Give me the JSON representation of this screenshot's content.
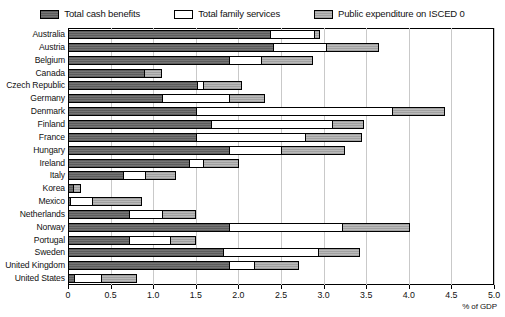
{
  "chart_data": {
    "type": "bar",
    "orientation": "horizontal",
    "stacked": true,
    "title": "",
    "xlabel": "% of GDP",
    "ylabel": "",
    "xlim": [
      0,
      5.0
    ],
    "xticks": [
      0,
      0.5,
      1.0,
      1.5,
      2.0,
      2.5,
      3.0,
      3.5,
      4.0,
      4.5,
      5.0
    ],
    "xticklabels": [
      "0",
      "0.5",
      "1.0",
      "1.5",
      "2.0",
      "2.5",
      "3.0",
      "3.5",
      "4.0",
      "4.5",
      "5.0"
    ],
    "grid": true,
    "legend_position": "top",
    "categories": [
      "Australia",
      "Austria",
      "Belgium",
      "Canada",
      "Czech Republic",
      "Germany",
      "Denmark",
      "Finland",
      "France",
      "Hungary",
      "Ireland",
      "Italy",
      "Korea",
      "Mexico",
      "Netherlands",
      "Norway",
      "Portugal",
      "Sweden",
      "United Kingdom",
      "United States"
    ],
    "series": [
      {
        "name": "Total cash benefits",
        "color": "#6e6e6e",
        "values": [
          2.38,
          2.42,
          1.9,
          0.9,
          1.52,
          1.11,
          1.51,
          1.69,
          1.51,
          1.9,
          1.43,
          0.66,
          0.07,
          0.04,
          0.73,
          1.9,
          0.73,
          1.83,
          1.9,
          0.08
        ]
      },
      {
        "name": "Total family services",
        "color": "#ffffff",
        "values": [
          0.53,
          0.63,
          0.39,
          0.0,
          0.09,
          0.8,
          2.32,
          1.43,
          1.3,
          0.62,
          0.18,
          0.27,
          0.0,
          0.27,
          0.4,
          1.34,
          0.49,
          1.13,
          0.31,
          0.33
        ]
      },
      {
        "name": "Public expenditure on ISCED 0",
        "color": "#b2b2b2",
        "values": [
          0.07,
          0.62,
          0.61,
          0.22,
          0.46,
          0.42,
          0.62,
          0.38,
          0.66,
          0.76,
          0.42,
          0.36,
          0.09,
          0.58,
          0.4,
          0.8,
          0.31,
          0.49,
          0.53,
          0.42
        ]
      }
    ],
    "totals": [
      2.98,
      3.67,
      2.9,
      1.12,
      2.07,
      2.33,
      4.45,
      3.5,
      3.47,
      3.28,
      2.03,
      1.29,
      0.16,
      0.89,
      1.53,
      4.04,
      1.53,
      3.45,
      2.74,
      0.83
    ]
  },
  "legend": {
    "items": [
      {
        "label": "Total cash benefits",
        "swatch": "fill-cash"
      },
      {
        "label": "Total family services",
        "swatch": "fill-services"
      },
      {
        "label": "Public expenditure on ISCED 0",
        "swatch": "fill-isced"
      }
    ]
  },
  "axis": {
    "unit_label": "% of GDP"
  }
}
